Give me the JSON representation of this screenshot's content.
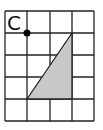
{
  "diagram": {
    "grid": {
      "cols": 4,
      "rows": 5,
      "origin_x": 5,
      "origin_y": 11,
      "cell": 22,
      "line_color": "#222222"
    },
    "point": {
      "label": "C",
      "x": 27,
      "y": 33,
      "color": "#000000"
    },
    "triangle": {
      "points": "27,99 72,33 72,99",
      "fill": "#c8c8c8",
      "stroke": "#222222"
    }
  }
}
